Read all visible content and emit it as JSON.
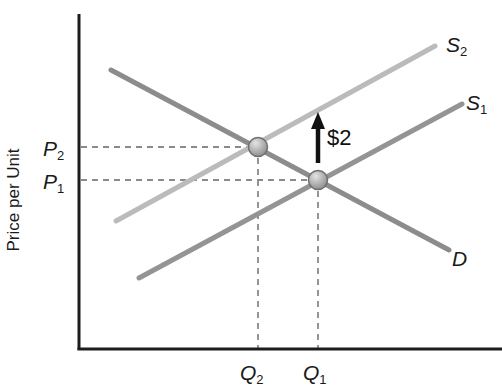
{
  "figure": {
    "width": 502,
    "height": 392,
    "background": "#ffffff"
  },
  "chart_data": {
    "type": "line",
    "title": "",
    "xlabel": "",
    "ylabel": "Price per Unit",
    "axes": {
      "color": "#1c1c1c",
      "stroke_width": 3,
      "origin_x": 79,
      "origin_y": 349,
      "y_top": 14,
      "x_right": 502
    },
    "y_axis_title": {
      "text": "Price per Unit",
      "x": 19,
      "y": 200,
      "rotation": -90,
      "font_size": 17
    },
    "series": [
      {
        "id": "supply-S2",
        "kind": "supply",
        "label_main": "S",
        "label_sub": "2",
        "color": "#b9bbbd",
        "stroke_width": 5,
        "x1": 116,
        "y1": 221,
        "x2": 435,
        "y2": 46,
        "label_x": 446,
        "label_y": 52
      },
      {
        "id": "supply-S1",
        "kind": "supply",
        "label_main": "S",
        "label_sub": "1",
        "color": "#929496",
        "stroke_width": 5,
        "x1": 139,
        "y1": 278,
        "x2": 462,
        "y2": 104,
        "label_x": 466,
        "label_y": 110
      },
      {
        "id": "demand-D",
        "kind": "demand",
        "label_main": "D",
        "label_sub": "",
        "color": "#8c8c8c",
        "stroke_width": 5,
        "x1": 111,
        "y1": 70,
        "x2": 449,
        "y2": 250,
        "label_x": 452,
        "label_y": 266
      }
    ],
    "guides": {
      "color": "#8a8a8a",
      "stroke_width": 1.8,
      "dash": "6 5",
      "lines": [
        {
          "id": "guide-P2-horizontal",
          "x1": 81,
          "y1": 147,
          "x2": 258,
          "y2": 147
        },
        {
          "id": "guide-P1-horizontal",
          "x1": 81,
          "y1": 180,
          "x2": 318,
          "y2": 180
        },
        {
          "id": "guide-Q2-vertical",
          "x1": 258,
          "y1": 147,
          "x2": 258,
          "y2": 348
        },
        {
          "id": "guide-Q1-vertical",
          "x1": 318,
          "y1": 180,
          "x2": 318,
          "y2": 348
        }
      ]
    },
    "points": [
      {
        "id": "equilibrium-new",
        "cx": 258,
        "cy": 147,
        "r": 9.5
      },
      {
        "id": "equilibrium-initial",
        "cx": 318,
        "cy": 180,
        "r": 9.5
      }
    ],
    "point_style": {
      "fill_light": "#e3e3e3",
      "fill_dark": "#8b8b8b",
      "stroke": "#6f6f6f",
      "stroke_width": 1.5
    },
    "axis_tick_labels": [
      {
        "id": "label-P2",
        "main": "P",
        "sub": "2",
        "x": 43,
        "y": 156
      },
      {
        "id": "label-P1",
        "main": "P",
        "sub": "1",
        "x": 43,
        "y": 189
      },
      {
        "id": "label-Q2",
        "main": "Q",
        "sub": "2",
        "x": 240,
        "y": 380
      },
      {
        "id": "label-Q1",
        "main": "Q",
        "sub": "1",
        "x": 303,
        "y": 380
      }
    ],
    "label_font_size": 21,
    "sub_font_size": 13,
    "shift_arrow": {
      "x": 318,
      "y_from": 163,
      "y_to": 112,
      "head_half_width": 7,
      "head_length": 17,
      "shaft_width": 4.5,
      "color": "#111111",
      "label": "$2",
      "label_x": 327,
      "label_y": 145,
      "label_font_size": 22
    }
  }
}
